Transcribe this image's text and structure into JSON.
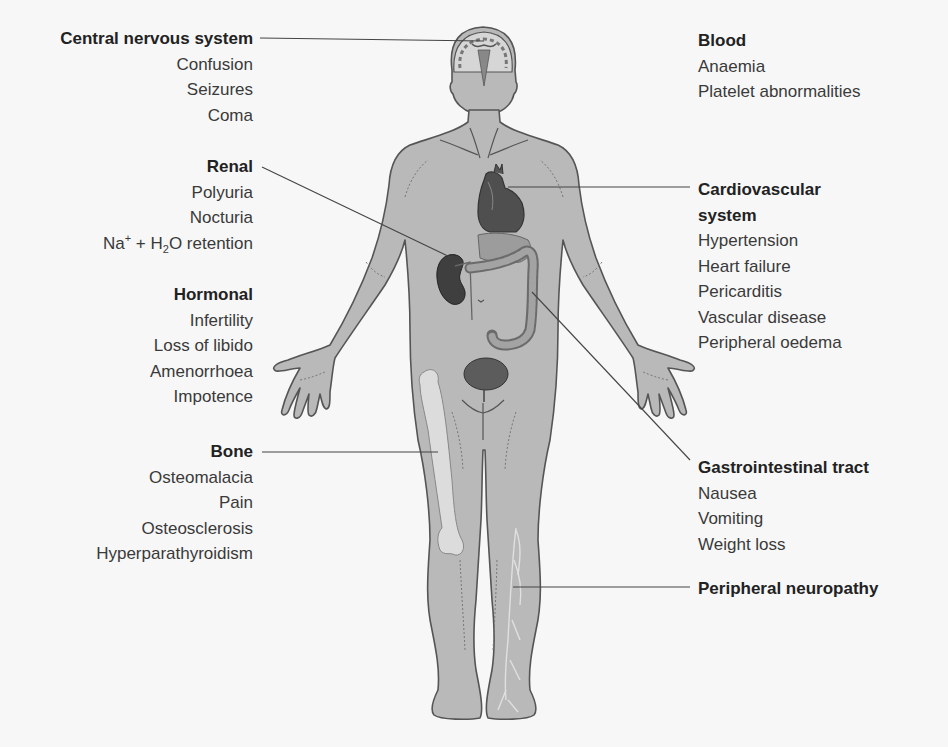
{
  "figure": {
    "colors": {
      "background": "#f7f7f7",
      "body_fill": "#b9b9b9",
      "body_stroke": "#555555",
      "organ_dark": "#5a5a5a",
      "bone": "#dcdcdc",
      "leader_line": "#444444",
      "text": "#333333"
    }
  },
  "groups": {
    "cns": {
      "title": "Central nervous system",
      "items": [
        "Confusion",
        "Seizures",
        "Coma"
      ]
    },
    "renal": {
      "title": "Renal",
      "items": [
        "Polyuria",
        "Nocturia"
      ],
      "retention": {
        "na": "Na",
        "plus": "+",
        "mid": " + H",
        "sub": "2",
        "end": "O retention"
      }
    },
    "hormonal": {
      "title": "Hormonal",
      "items": [
        "Infertility",
        "Loss of libido",
        "Amenorrhoea",
        "Impotence"
      ]
    },
    "bone": {
      "title": "Bone",
      "items": [
        "Osteomalacia",
        "Pain",
        "Osteosclerosis",
        "Hyperparathyroidism"
      ]
    },
    "blood": {
      "title": "Blood",
      "items": [
        "Anaemia",
        "Platelet abnormalities"
      ]
    },
    "cardio": {
      "title_line1": "Cardiovascular",
      "title_line2": "system",
      "items": [
        "Hypertension",
        "Heart failure",
        "Pericarditis",
        "Vascular disease",
        "Peripheral oedema"
      ]
    },
    "gi": {
      "title": "Gastrointestinal tract",
      "items": [
        "Nausea",
        "Vomiting",
        "Weight loss"
      ]
    },
    "neuro": {
      "title": "Peripheral neuropathy"
    }
  }
}
